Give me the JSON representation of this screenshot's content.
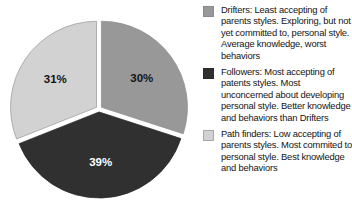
{
  "chart_data": {
    "type": "pie",
    "title": "",
    "xlabel": "",
    "ylabel": "",
    "grid": false,
    "legend_position": "right",
    "start_angle_deg": 0,
    "direction": "clockwise",
    "categories": [
      "Drifters",
      "Followers",
      "Path finders"
    ],
    "values": [
      30,
      39,
      31
    ],
    "value_labels": [
      "30%",
      "39%",
      "31%"
    ],
    "colors": [
      "#989898",
      "#303030",
      "#d2d2d2"
    ],
    "slices": [
      {
        "name": "Drifters",
        "value": 30,
        "label": "30%",
        "color": "#989898",
        "label_color": "#141414",
        "position": "top-right"
      },
      {
        "name": "Followers",
        "value": 39,
        "label": "39%",
        "color": "#303030",
        "label_color": "#ffffff",
        "position": "bottom"
      },
      {
        "name": "Path finders",
        "value": 31,
        "label": "31%",
        "color": "#d2d2d2",
        "label_color": "#141414",
        "position": "left"
      }
    ]
  },
  "legend": {
    "entries": [
      {
        "swatch_color": "#989898",
        "swatch_border": "#8a8a8a",
        "text": "Drifters: Least accepting of parents styles. Exploring, but not yet committed to, personal style. Average knowledge, worst behaviors"
      },
      {
        "swatch_color": "#303030",
        "swatch_border": "#2a2a2a",
        "text": "Followers: Most accepting of patents  styles. Most unconcerned about developing personal style. Better knowledge and behaviors than Drifters"
      },
      {
        "swatch_color": "#d2d2d2",
        "swatch_border": "#a8a8a8",
        "text": "Path finders: Low accepting of parents styles. Most commited to personal style. Best knowledge and behaviors"
      }
    ]
  }
}
